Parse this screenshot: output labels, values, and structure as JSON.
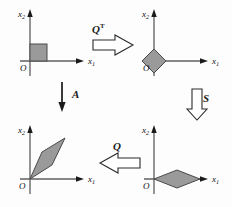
{
  "figure": {
    "axis_color": "#5f5f5f",
    "shape_fill": "#9a9a9a",
    "shape_stroke": "#4a4a4a",
    "arrow_outline": "#2b2b2b",
    "arrow_fill": "#ffffff",
    "label_color": "#111111"
  },
  "panels": [
    {
      "id": "top-left",
      "name": "unit-square-panel",
      "x_axis_label": "x",
      "x_axis_sub": "1",
      "y_axis_label": "x",
      "y_axis_sub": "2",
      "origin_label": "O",
      "shape": "square",
      "shape_name": "unit-square"
    },
    {
      "id": "top-right",
      "name": "rotated-square-panel",
      "x_axis_label": "x",
      "x_axis_sub": "1",
      "y_axis_label": "x",
      "y_axis_sub": "2",
      "origin_label": "O",
      "shape": "diamond",
      "shape_name": "rotated-square-diamond"
    },
    {
      "id": "bottom-right",
      "name": "scaled-rhombus-panel",
      "x_axis_label": "x",
      "x_axis_sub": "1",
      "y_axis_label": "x",
      "y_axis_sub": "2",
      "origin_label": "O",
      "shape": "flat-rhombus",
      "shape_name": "scaled-flat-rhombus"
    },
    {
      "id": "bottom-left",
      "name": "parallelogram-panel",
      "x_axis_label": "x",
      "x_axis_sub": "1",
      "y_axis_label": "x",
      "y_axis_sub": "2",
      "origin_label": "O",
      "shape": "parallelogram",
      "shape_name": "sheared-parallelogram"
    }
  ],
  "arrows": [
    {
      "id": "qt",
      "name": "arrow-q-transpose",
      "label": "Q",
      "superscript": "T",
      "direction": "right"
    },
    {
      "id": "s",
      "name": "arrow-s",
      "label": "S",
      "superscript": "",
      "direction": "down"
    },
    {
      "id": "a",
      "name": "arrow-a",
      "label": "A",
      "superscript": "",
      "direction": "down"
    },
    {
      "id": "q",
      "name": "arrow-q",
      "label": "Q",
      "superscript": "",
      "direction": "left"
    }
  ]
}
